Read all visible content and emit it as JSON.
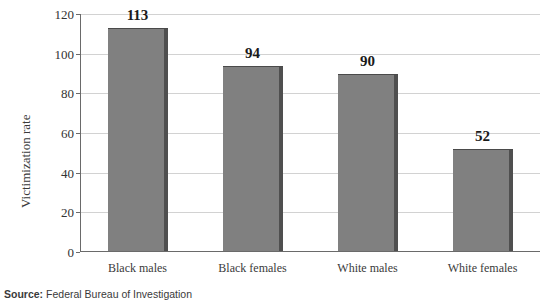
{
  "chart_data": {
    "type": "bar",
    "title": "",
    "subtitle": "",
    "xlabel": "",
    "ylabel": "Victimization rate",
    "categories": [
      "Black males",
      "Black females",
      "White males",
      "White females"
    ],
    "values": [
      113,
      94,
      90,
      52
    ],
    "value_labels": [
      "113",
      "94",
      "90",
      "52"
    ],
    "ylim": [
      0,
      120
    ],
    "yticks": [
      0,
      20,
      40,
      60,
      80,
      100,
      120
    ],
    "ytick_labels": [
      "0",
      "20",
      "40",
      "60",
      "80",
      "100",
      "120"
    ],
    "grid": true,
    "grid_axis": "y",
    "legend": false,
    "legend_position": "none",
    "bar_color": "#808080",
    "bar_shadow_color": "#4f4f4f",
    "grid_color": "#d2d2d2",
    "axis_color": "#6a6a6a",
    "value_label_color": "#1a1a1a"
  },
  "source": {
    "label": "Source:",
    "text": "Federal Bureau of Investigation"
  }
}
